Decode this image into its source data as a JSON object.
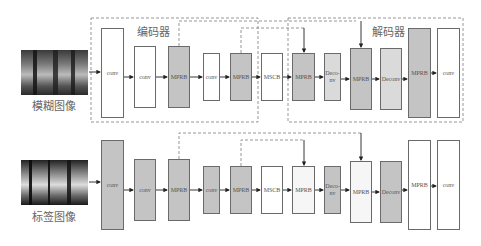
{
  "diagram": {
    "top_row": {
      "input_label": "模糊图像",
      "encoder_label": "编码器",
      "decoder_label": "解码器",
      "blocks": [
        {
          "label": "conv",
          "fill": "white"
        },
        {
          "label": "conv",
          "fill": "white"
        },
        {
          "label": "MPRB",
          "fill": "gray"
        },
        {
          "label": "conv",
          "fill": "white"
        },
        {
          "label": "MPRB",
          "fill": "gray"
        },
        {
          "label": "MSCB",
          "fill": "white"
        },
        {
          "label": "MPRB",
          "fill": "gray"
        },
        {
          "label": "Deco-nv",
          "fill": "light-gray"
        },
        {
          "label": "MPRB",
          "fill": "gray"
        },
        {
          "label": "Deconv",
          "fill": "light-gray"
        },
        {
          "label": "MPRB",
          "fill": "gray"
        },
        {
          "label": "conv",
          "fill": "white"
        }
      ]
    },
    "bottom_row": {
      "input_label": "标签图像",
      "blocks": [
        {
          "label": "conv",
          "fill": "gray"
        },
        {
          "label": "conv",
          "fill": "gray"
        },
        {
          "label": "MPRB",
          "fill": "gray"
        },
        {
          "label": "conv",
          "fill": "gray"
        },
        {
          "label": "MPRB",
          "fill": "gray"
        },
        {
          "label": "MSCB",
          "fill": "white"
        },
        {
          "label": "MPRB",
          "fill": "white"
        },
        {
          "label": "Deco-nv",
          "fill": "gray"
        },
        {
          "label": "MPRB",
          "fill": "white"
        },
        {
          "label": "Deconv",
          "fill": "gray"
        },
        {
          "label": "MPRB",
          "fill": "white"
        },
        {
          "label": "conv",
          "fill": "white"
        }
      ]
    },
    "colors": {
      "gray_fill": "#c4c4c4",
      "light_gray_fill": "#dadada",
      "border": "#6a6a6a",
      "dashed": "#8a8a8a"
    }
  }
}
